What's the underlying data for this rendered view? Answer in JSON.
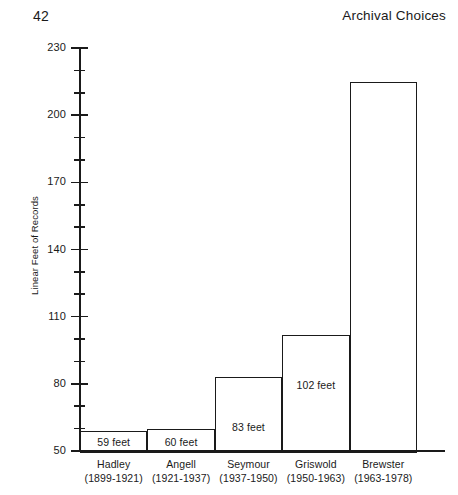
{
  "page": {
    "number": "42",
    "running_head": "Archival Choices"
  },
  "chart_data": {
    "type": "bar",
    "title": "",
    "xlabel": "",
    "ylabel": "Linear Feet of Records",
    "ylim": [
      50,
      230
    ],
    "ytick_major_step": 30,
    "ytick_minor_step": 10,
    "grid": false,
    "legend": null,
    "bar_style": "outline",
    "categories": [
      "Hadley",
      "Angell",
      "Seymour",
      "Griswold",
      "Brewster"
    ],
    "category_sublabels": [
      "(1899-1921)",
      "(1921-1937)",
      "(1937-1950)",
      "(1950-1963)",
      "(1963-1978)"
    ],
    "values": [
      59,
      60,
      83,
      102,
      215
    ],
    "data_labels": [
      "59 feet",
      "60 feet",
      "83 feet",
      "102 feet",
      ""
    ],
    "ytick_labels": [
      "230",
      "200",
      "170",
      "140",
      "110",
      "80",
      "50"
    ],
    "ytick_values": [
      230,
      200,
      170,
      140,
      110,
      80,
      50
    ]
  },
  "axis": {
    "title": "Linear Feet of Records"
  }
}
